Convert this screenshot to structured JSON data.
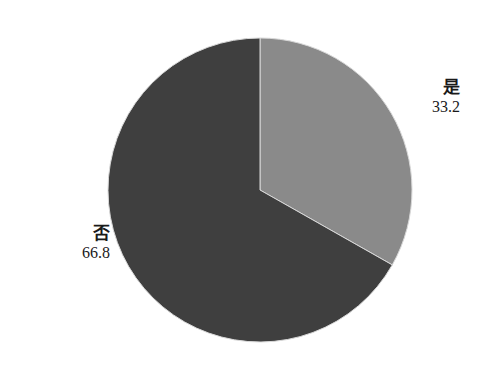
{
  "chart_data": {
    "type": "pie",
    "title": "",
    "categories": [
      "是",
      "否"
    ],
    "values": [
      33.2,
      66.8
    ],
    "colors": [
      "#8a8a8a",
      "#3f3f3f"
    ],
    "start_angle_deg": 0,
    "direction": "clockwise",
    "labels": [
      {
        "category": "是",
        "value": "33.2"
      },
      {
        "category": "否",
        "value": "66.8"
      }
    ],
    "legend": "none"
  }
}
